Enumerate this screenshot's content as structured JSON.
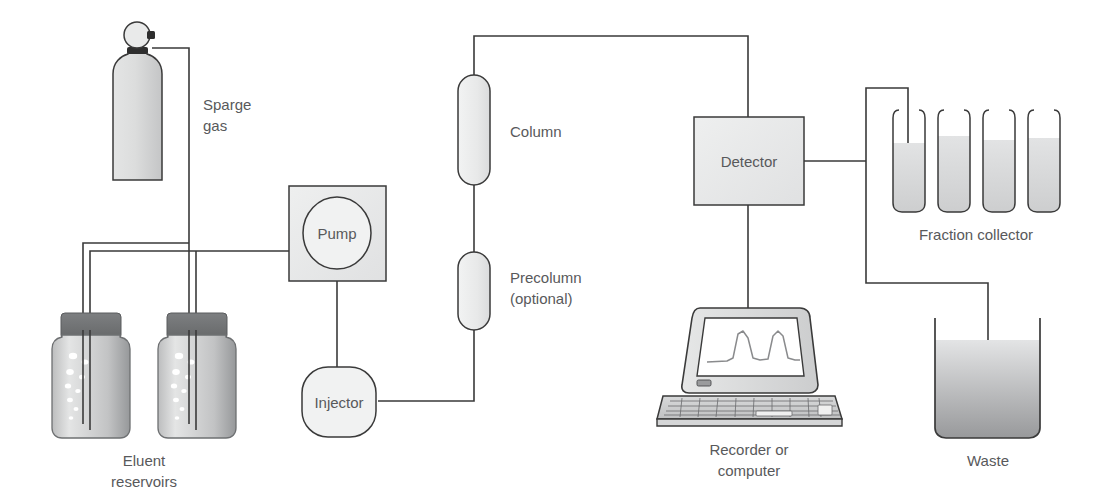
{
  "diagram": {
    "background_color": "#ffffff",
    "line_color": "#3a3a3a",
    "text_color": "#58595b",
    "fill_light": "#eceded",
    "fill_mid": "#d2d3d4",
    "fill_dark": "#6e6f71"
  },
  "labels": {
    "sparge_gas_line1": "Sparge",
    "sparge_gas_line2": "gas",
    "eluent_reservoirs_line1": "Eluent",
    "eluent_reservoirs_line2": "reservoirs",
    "pump": "Pump",
    "injector": "Injector",
    "column": "Column",
    "precolumn_line1": "Precolumn",
    "precolumn_line2": "(optional)",
    "detector": "Detector",
    "fraction_collector": "Fraction collector",
    "recorder_line1": "Recorder or",
    "recorder_line2": "computer",
    "waste": "Waste"
  },
  "components": {
    "gas_cylinder": {
      "name": "sparge-gas-cylinder",
      "count": 1
    },
    "eluent_reservoirs": {
      "name": "eluent-reservoir",
      "count": 2,
      "bubbles_per_reservoir": 9
    },
    "pump": {
      "shape": "square-with-circle"
    },
    "injector": {
      "shape": "rounded-square"
    },
    "column": {
      "shape": "capsule"
    },
    "precolumn": {
      "shape": "capsule"
    },
    "detector": {
      "shape": "square"
    },
    "fraction_collector": {
      "tube_count": 4
    },
    "recorder": {
      "screen_trace_peaks": 2
    },
    "waste": {
      "shape": "beaker"
    }
  }
}
